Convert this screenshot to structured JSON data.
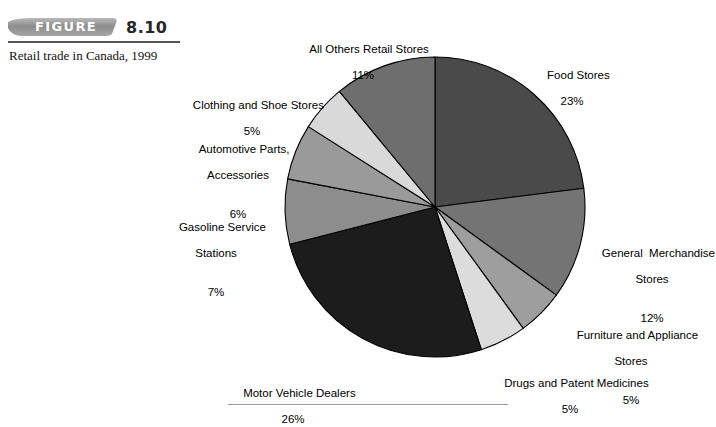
{
  "figure": {
    "banner_word": "FIGURE",
    "number": "8.10",
    "caption": "Retail trade in\nCanada, 1999"
  },
  "chart_data": {
    "type": "pie",
    "title": "Retail trade in Canada, 1999",
    "xlabel": "",
    "ylabel": "",
    "legend_position": "none",
    "grid": false,
    "start_angle_deg": 0,
    "direction": "clockwise",
    "categories": [
      "Food Stores",
      "General  Merchandise Stores",
      "Furniture and Appliance Stores",
      "Drugs and Patent Medicines",
      "Motor Vehicle Dealers",
      "Gasoline Service Stations",
      "Automotive Parts, Accessories",
      "Clothing and Shoe Stores",
      "All Others Retail Stores"
    ],
    "values": [
      23,
      12,
      5,
      5,
      26,
      7,
      6,
      5,
      11
    ],
    "value_unit": "%",
    "colors": [
      "#4a4a4a",
      "#747474",
      "#9e9e9e",
      "#dcdcdc",
      "#1c1c1c",
      "#8d8d8d",
      "#9a9a9a",
      "#d9d9d9",
      "#6e6e6e"
    ],
    "slices": [
      {
        "label": "Food Stores",
        "pct_text": "23%",
        "value": 23,
        "color": "#4a4a4a"
      },
      {
        "label": "General  Merchandise",
        "label2": "Stores",
        "pct_text": "12%",
        "value": 12,
        "color": "#747474"
      },
      {
        "label": "Furniture and Appliance",
        "label2": "Stores",
        "pct_text": "5%",
        "value": 5,
        "color": "#9e9e9e"
      },
      {
        "label": "Drugs and Patent Medicines",
        "pct_text": "5%",
        "value": 5,
        "color": "#dcdcdc"
      },
      {
        "label": "Motor Vehicle Dealers",
        "pct_text": "26%",
        "value": 26,
        "color": "#1c1c1c"
      },
      {
        "label": "Gasoline Service",
        "label2": "Stations",
        "pct_text": "7%",
        "value": 7,
        "color": "#8d8d8d"
      },
      {
        "label": "Automotive Parts,",
        "label2": "Accessories",
        "pct_text": "6%",
        "value": 6,
        "color": "#9a9a9a"
      },
      {
        "label": "Clothing and Shoe Stores",
        "pct_text": "5%",
        "value": 5,
        "color": "#d9d9d9"
      },
      {
        "label": "All Others Retail Stores",
        "pct_text": "11%",
        "value": 11,
        "color": "#6e6e6e"
      }
    ]
  },
  "labels": {
    "all_others": {
      "line1": "All Others Retail Stores",
      "pct": "11%"
    },
    "food": {
      "line1": "Food Stores",
      "pct": "23%"
    },
    "general": {
      "line1": "General  Merchandise",
      "line2": "Stores",
      "pct": "12%"
    },
    "furniture": {
      "line1": "Furniture and Appliance",
      "line2": "Stores",
      "pct": "5%"
    },
    "drugs": {
      "line1": "Drugs and Patent Medicines",
      "pct": "5%"
    },
    "motor": {
      "line1": "Motor Vehicle Dealers",
      "pct": "26%"
    },
    "gasoline": {
      "line1": "Gasoline Service",
      "line2": "Stations",
      "pct": "7%"
    },
    "automotive": {
      "line1": "Automotive Parts,",
      "line2": "Accessories",
      "pct": "6%"
    },
    "clothing": {
      "line1": "Clothing and Shoe Stores",
      "pct": "5%"
    }
  }
}
